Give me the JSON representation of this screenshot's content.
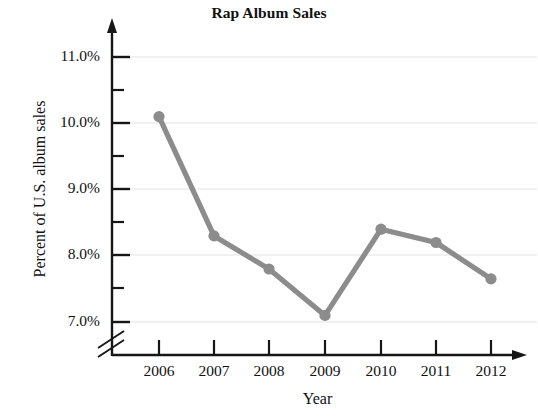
{
  "chart_data": {
    "type": "line",
    "title": "Rap Album Sales",
    "xlabel": "Year",
    "ylabel": "Percent of U.S. album sales",
    "categories": [
      "2006",
      "2007",
      "2008",
      "2009",
      "2010",
      "2011",
      "2012"
    ],
    "x": [
      2006,
      2007,
      2008,
      2009,
      2010,
      2011,
      2012
    ],
    "values": [
      10.1,
      8.3,
      7.8,
      7.1,
      8.4,
      8.2,
      7.65
    ],
    "series": [
      {
        "name": "Percent of U.S. album sales",
        "values": [
          10.1,
          8.3,
          7.8,
          7.1,
          8.4,
          8.2,
          7.65
        ]
      }
    ],
    "ytick_labels": [
      "11.0%",
      "10.0%",
      "9.0%",
      "8.0%",
      "7.0%"
    ],
    "ytick_values": [
      11.0,
      10.0,
      9.0,
      8.0,
      7.0
    ],
    "yminor_values": [
      10.5,
      9.5,
      8.5,
      7.5
    ],
    "ylim": [
      6.85,
      11.4
    ],
    "xlim": [
      2005.5,
      2012.6
    ],
    "grid": "horizontal",
    "legend": "none",
    "axis_break": "y-axis broken below 7.0%",
    "series_color": "#8c8c8c",
    "grid_color": "#e2e2e2",
    "axis_color": "#1a1a1a",
    "marker": "circle"
  },
  "ytick_labels": [
    {
      "text": "11.0%"
    },
    {
      "text": "10.0%"
    },
    {
      "text": "9.0%"
    },
    {
      "text": "8.0%"
    },
    {
      "text": "7.0%"
    }
  ],
  "xtick_labels": [
    {
      "text": "2006"
    },
    {
      "text": "2007"
    },
    {
      "text": "2008"
    },
    {
      "text": "2009"
    },
    {
      "text": "2010"
    },
    {
      "text": "2011"
    },
    {
      "text": "2012"
    }
  ]
}
